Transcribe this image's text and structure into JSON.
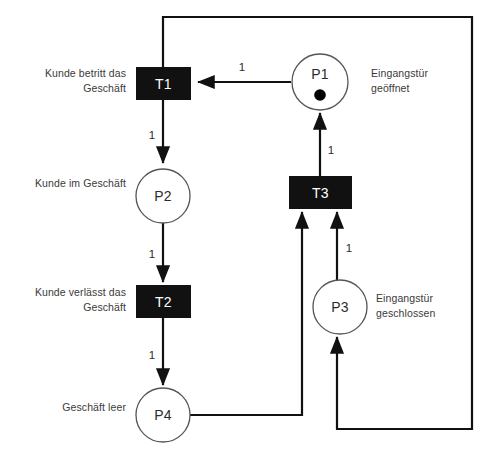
{
  "diagram": {
    "type": "petri-net",
    "colors": {
      "transition_fill": "#111111",
      "transition_label": "#ffffff",
      "place_stroke": "#555555",
      "place_fill": "#ffffff",
      "arc_stroke": "#111111",
      "text": "#3a3a3a",
      "token_fill": "#000000"
    }
  },
  "places": [
    {
      "id": "P1",
      "name": "P1",
      "label": "Eingangstür\ngeöffnet",
      "label_side": "right",
      "tokens": 1,
      "cx": 320,
      "cy": 82,
      "r": 28
    },
    {
      "id": "P2",
      "name": "P2",
      "label": "Kunde im Geschäft",
      "label_side": "left",
      "tokens": 0,
      "cx": 163,
      "cy": 196,
      "r": 27
    },
    {
      "id": "P3",
      "name": "P3",
      "label": "Eingangstür\ngeschlossen",
      "label_side": "right",
      "tokens": 0,
      "cx": 340,
      "cy": 307,
      "r": 27
    },
    {
      "id": "P4",
      "name": "P4",
      "label": "Geschäft leer",
      "label_side": "left",
      "tokens": 0,
      "cx": 163,
      "cy": 415,
      "r": 27
    }
  ],
  "transitions": [
    {
      "id": "T1",
      "name": "T1",
      "label": "Kunde betritt das\nGeschäft",
      "label_side": "left",
      "x": 136,
      "y": 67,
      "w": 55,
      "h": 33
    },
    {
      "id": "T2",
      "name": "T2",
      "label": "Kunde verlässt das\nGeschäft",
      "label_side": "left",
      "x": 136,
      "y": 285,
      "w": 55,
      "h": 33
    },
    {
      "id": "T3",
      "name": "T3",
      "label": "",
      "label_side": "none",
      "x": 289,
      "y": 176,
      "w": 63,
      "h": 33
    }
  ],
  "arcs": [
    {
      "id": "arc-p1-t1",
      "from": "P1",
      "to": "T1",
      "weight": "1",
      "weight_x": 242,
      "weight_y": 70
    },
    {
      "id": "arc-t1-p2",
      "from": "T1",
      "to": "P2",
      "weight": "1",
      "weight_x": 152,
      "weight_y": 135
    },
    {
      "id": "arc-p2-t2",
      "from": "P2",
      "to": "T2",
      "weight": "1",
      "weight_x": 152,
      "weight_y": 254
    },
    {
      "id": "arc-t2-p4",
      "from": "T2",
      "to": "P4",
      "weight": "1",
      "weight_x": 152,
      "weight_y": 355
    },
    {
      "id": "arc-t3-p1",
      "from": "T3",
      "to": "P1",
      "weight": "1",
      "weight_x": 330,
      "weight_y": 150
    },
    {
      "id": "arc-p3-t3",
      "from": "P3",
      "to": "T3",
      "weight": "1",
      "weight_x": 348,
      "weight_y": 248
    },
    {
      "id": "arc-p4-t3",
      "from": "P4",
      "to": "T3",
      "weight": "",
      "weight_x": 0,
      "weight_y": 0
    },
    {
      "id": "arc-t1-p3",
      "from": "T1",
      "to": "P3",
      "weight": "",
      "weight_x": 0,
      "weight_y": 0
    }
  ]
}
